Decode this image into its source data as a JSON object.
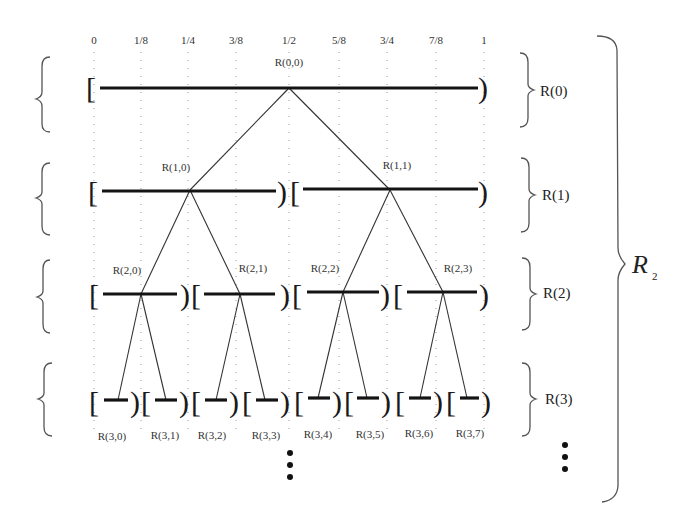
{
  "diagram": {
    "axis_ticks": [
      {
        "label": "0",
        "x": 94
      },
      {
        "label": "1/8",
        "x": 141
      },
      {
        "label": "1/4",
        "x": 188
      },
      {
        "label": "3/8",
        "x": 236
      },
      {
        "label": "1/2",
        "x": 289
      },
      {
        "label": "5/8",
        "x": 339
      },
      {
        "label": "3/4",
        "x": 387
      },
      {
        "label": "7/8",
        "x": 436
      },
      {
        "label": "1",
        "x": 484
      }
    ],
    "levels": [
      {
        "label": "R(0)",
        "nodes": [
          "R(0,0)"
        ]
      },
      {
        "label": "R(1)",
        "nodes": [
          "R(1,0)",
          "R(1,1)"
        ]
      },
      {
        "label": "R(2)",
        "nodes": [
          "R(2,0)",
          "R(2,1)",
          "R(2,2)",
          "R(2,3)"
        ]
      },
      {
        "label": "R(3)",
        "nodes": [
          "R(3,0)",
          "R(3,1)",
          "R(3,2)",
          "R(3,3)",
          "R(3,4)",
          "R(3,5)",
          "R(3,6)",
          "R(3,7)"
        ]
      }
    ],
    "interval_open_bracket": "[",
    "interval_close_bracket": ")",
    "collection_label": "R",
    "collection_subscript": "2",
    "continuation_symbol": "⋮"
  }
}
